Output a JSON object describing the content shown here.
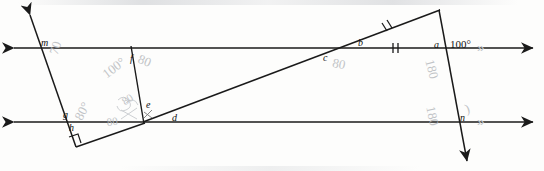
{
  "diagram": {
    "given_angle": "100°",
    "ink_color": "#1a1a1a",
    "pencil_color": "#b9bcc0"
  },
  "angle_labels": [
    {
      "key": "m",
      "text": "m"
    },
    {
      "key": "f",
      "text": "f"
    },
    {
      "key": "a",
      "text": "a"
    },
    {
      "key": "b",
      "text": "b"
    },
    {
      "key": "c",
      "text": "c"
    },
    {
      "key": "d",
      "text": "d"
    },
    {
      "key": "e",
      "text": "e"
    },
    {
      "key": "g",
      "text": "g"
    },
    {
      "key": "h",
      "text": "h"
    },
    {
      "key": "n",
      "text": "n"
    }
  ],
  "given": {
    "top_right_angle": "100°"
  },
  "pencil_work": [
    {
      "key": "p70",
      "text": "70"
    },
    {
      "key": "p100",
      "text": "100°"
    },
    {
      "key": "p80f",
      "text": "80"
    },
    {
      "key": "p80c",
      "text": "80"
    },
    {
      "key": "p180a",
      "text": "180"
    },
    {
      "key": "p180n",
      "text": "180"
    },
    {
      "key": "p80g",
      "text": "80°"
    },
    {
      "key": "p80e",
      "text": "80"
    },
    {
      "key": "p80d",
      "text": "80"
    }
  ],
  "markings": {
    "parallel_chevron_top": "»",
    "parallel_chevron_bottom": "»",
    "congruent_ticks": "||",
    "right_angle": "square"
  }
}
